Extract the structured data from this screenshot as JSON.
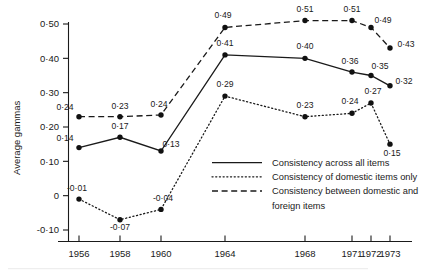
{
  "chart_data": {
    "type": "line",
    "title": "",
    "xlabel": "",
    "ylabel": "Average gammas",
    "x": [
      1956,
      1958,
      1960,
      1964,
      1968,
      1971,
      1972,
      1973
    ],
    "xtick_labels": [
      "1956",
      "1958",
      "1960",
      "1964",
      "1968",
      "1971",
      "1972",
      "1973"
    ],
    "ytick_labels": [
      "0·50",
      "0·40",
      "0·30",
      "0·20",
      "0·10",
      "0",
      "-0·10"
    ],
    "ytick_values": [
      0.5,
      0.4,
      0.3,
      0.2,
      0.1,
      0.0,
      -0.1
    ],
    "ylim": [
      -0.13,
      0.54
    ],
    "xlim": [
      1955.2,
      1973.9
    ],
    "grid": false,
    "legend_position": "inside-bottom-right",
    "series": [
      {
        "name": "Consistency across all items",
        "style": "solid",
        "values": [
          0.14,
          0.17,
          0.13,
          0.41,
          0.4,
          0.36,
          0.35,
          0.32
        ],
        "labels": [
          "0·14",
          "0·17",
          "0·13",
          "0·41",
          "0·40",
          "0·36",
          "0·35",
          "0·32"
        ]
      },
      {
        "name": "Consistency of domestic items only",
        "style": "dotted",
        "values": [
          -0.01,
          -0.07,
          -0.04,
          0.29,
          0.23,
          0.24,
          0.27,
          0.15
        ],
        "labels": [
          "-0·01",
          "-0·07",
          "-0·04",
          "0·29",
          "0·23",
          "0·24",
          "0·27",
          "0·15"
        ]
      },
      {
        "name": "Consistency between domestic and foreign items",
        "style": "dashed",
        "values": [
          0.23,
          0.23,
          0.235,
          0.49,
          0.51,
          0.51,
          0.49,
          0.43
        ],
        "labels": [
          "0·24",
          "0·23",
          "0·24",
          "0·49",
          "0·51",
          "0·51",
          "0·49",
          "0·43"
        ]
      }
    ]
  },
  "axis": {
    "y_title": "Average gammas"
  },
  "legend": {
    "items": [
      {
        "label": "Consistency across all items",
        "style": "solid"
      },
      {
        "label": "Consistency of domestic items only",
        "style": "dotted"
      },
      {
        "label": "Consistency between domestic and",
        "style": "dashed"
      },
      {
        "label": "foreign items",
        "style": "none"
      }
    ]
  }
}
